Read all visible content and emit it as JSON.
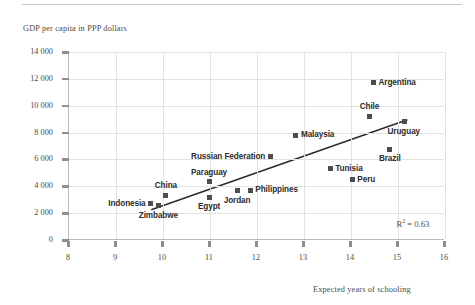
{
  "figure": {
    "y_axis_title": "GDP per capita in PPP dollars",
    "x_axis_title": "Expected years of schooling",
    "r2_prefix": "R",
    "r2_sup": "2",
    "r2_value": "= 0.63",
    "r2_full": "R2 = 0.63"
  },
  "chart_data": {
    "type": "scatter",
    "title": "",
    "xlabel": "Expected years of schooling",
    "ylabel": "GDP per capita in PPP dollars",
    "xlim": [
      8,
      16
    ],
    "ylim": [
      0,
      14000
    ],
    "xticks": [
      "8",
      "9",
      "10",
      "11",
      "12",
      "13",
      "14",
      "15",
      "16"
    ],
    "xtick_values": [
      8,
      9,
      10,
      11,
      12,
      13,
      14,
      15,
      16
    ],
    "yticks": [
      "0",
      "2 000",
      "4 000",
      "6 000",
      "8 000",
      "10 000",
      "12 000",
      "14 000"
    ],
    "ytick_values": [
      0,
      2000,
      4000,
      6000,
      8000,
      10000,
      12000,
      14000
    ],
    "grid": true,
    "legend": "none",
    "annotations": [
      {
        "text": "R2 = 0.63",
        "x": 15.2,
        "y": 1200
      }
    ],
    "trendline": {
      "type": "linear",
      "x_start": 9.75,
      "y_start": 2250,
      "x_end": 15.2,
      "y_end": 8950
    },
    "points": [
      {
        "name": "Indonesia",
        "x": 9.75,
        "y": 2700,
        "label_pos": "left"
      },
      {
        "name": "Zimbabwe",
        "x": 9.92,
        "y": 2550,
        "label_pos": "below"
      },
      {
        "name": "China",
        "x": 10.08,
        "y": 3350,
        "label_pos": "above"
      },
      {
        "name": "Egypt",
        "x": 11.0,
        "y": 3200,
        "label_pos": "below"
      },
      {
        "name": "Paraguay",
        "x": 11.0,
        "y": 4350,
        "label_pos": "above"
      },
      {
        "name": "Jordan",
        "x": 11.6,
        "y": 3650,
        "label_pos": "below"
      },
      {
        "name": "Philippines",
        "x": 11.88,
        "y": 3700,
        "label_pos": "right"
      },
      {
        "name": "Russian Federation",
        "x": 12.3,
        "y": 6200,
        "label_pos": "left"
      },
      {
        "name": "Malaysia",
        "x": 12.85,
        "y": 7800,
        "label_pos": "right"
      },
      {
        "name": "Tunisia",
        "x": 13.58,
        "y": 5300,
        "label_pos": "right"
      },
      {
        "name": "Peru",
        "x": 14.05,
        "y": 4500,
        "label_pos": "right"
      },
      {
        "name": "Chile",
        "x": 14.42,
        "y": 9200,
        "label_pos": "above"
      },
      {
        "name": "Argentina",
        "x": 14.5,
        "y": 11700,
        "label_pos": "right"
      },
      {
        "name": "Brazil",
        "x": 14.85,
        "y": 6750,
        "label_pos": "below"
      },
      {
        "name": "Uruguay",
        "x": 15.15,
        "y": 8800,
        "label_pos": "below"
      }
    ]
  }
}
